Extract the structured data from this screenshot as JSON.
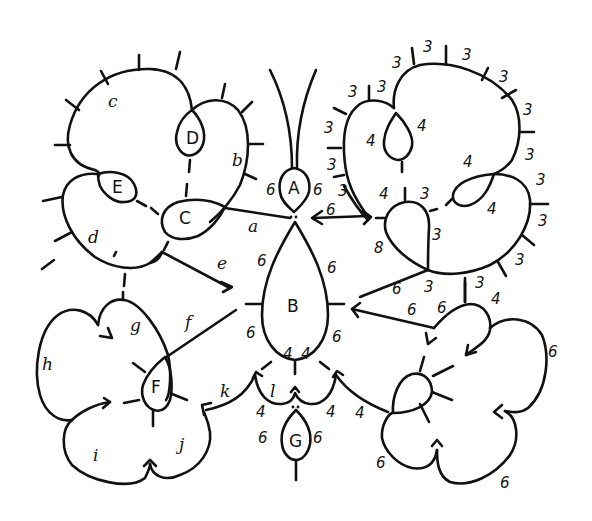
{
  "diagram": {
    "rings": {
      "A": "A",
      "B": "B",
      "C": "C",
      "D": "D",
      "E": "E",
      "F": "F",
      "G": "G"
    },
    "chains": {
      "a": "a",
      "b": "b",
      "c": "c",
      "d": "d",
      "e": "e",
      "f": "f",
      "g": "g",
      "h": "h",
      "i": "i",
      "j": "j",
      "k": "k",
      "l": "l"
    },
    "stitch_counts": {
      "A_left": "6",
      "A_right": "6",
      "B_upper_left": "6",
      "B_upper_right": "6",
      "B_lower_left": "6",
      "B_lower_right": "6",
      "B_bottom_left": "4",
      "B_bottom_right": "4",
      "G_left": "6",
      "G_right": "6",
      "l_left": "4",
      "l_right": "4",
      "l_right_outer": "4",
      "right_upper_ring_left": "4",
      "right_upper_ring_right": "4",
      "right_side_ring_top": "4",
      "right_side_ring_bottom": "4",
      "right_center_ring_top": "4",
      "right_center_ring_right_top": "3",
      "right_center_ring_side": "3",
      "right_center_ring_left": "8",
      "right_chain_picots": [
        "3",
        "3",
        "3",
        "3",
        "3",
        "3",
        "3",
        "3",
        "3",
        "3",
        "3",
        "3",
        "3",
        "3",
        "3",
        "3",
        "3"
      ],
      "right_arrow_label": "6",
      "right_lower_links": [
        "6",
        "3",
        "3",
        "6",
        "6",
        "4"
      ],
      "right_flower_side": "6",
      "right_flower_bottom": "6",
      "right_flower_left": "6",
      "B_right_arrow_label": "6"
    }
  }
}
